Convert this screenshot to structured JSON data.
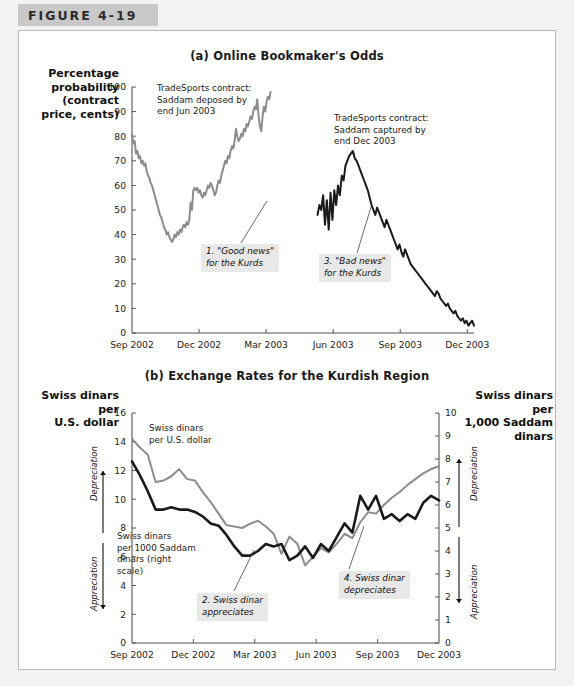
{
  "figure": {
    "tab_label": "FIGURE 4-19"
  },
  "panel_a": {
    "title": "(a) Online Bookmaker's Odds",
    "y_axis_title": "Percentage\nprobability\n(contract\nprice, cents)",
    "y_ticks": [
      0,
      10,
      20,
      30,
      40,
      50,
      60,
      70,
      80,
      90,
      100
    ],
    "x_ticks": [
      "Sep 2002",
      "Dec 2002",
      "Mar 2003",
      "Jun 2003",
      "Sep 2003",
      "Dec 2003"
    ],
    "note_deposed": "TradeSports contract:\nSaddam deposed by\nend Jun 2003",
    "note_captured": "TradeSports contract:\nSaddam captured by\nend Dec 2003",
    "callout_1": "1. \"Good news\"\nfor the Kurds",
    "callout_3": "3. \"Bad news\"\nfor the Kurds"
  },
  "panel_b": {
    "title": "(b) Exchange Rates for the Kurdish Region",
    "y_axis_title_left": "Swiss dinars per\nU.S. dollar",
    "y_axis_title_right": "Swiss dinars per\n1,000 Saddam\ndinars",
    "y_ticks_left": [
      0,
      2,
      4,
      6,
      8,
      10,
      12,
      14,
      16
    ],
    "y_ticks_right": [
      0,
      1,
      2,
      3,
      4,
      5,
      6,
      7,
      8,
      9,
      10
    ],
    "x_ticks": [
      "Sep 2002",
      "Dec 2002",
      "Mar 2003",
      "Jun 2003",
      "Sep 2003",
      "Dec 2003"
    ],
    "arrow_label_depreciation": "Depreciation",
    "arrow_label_appreciation": "Appreciation",
    "series_label_usd": "Swiss dinars\nper U.S. dollar",
    "series_label_saddam": "Swiss dinars\nper 1000 Saddam\ndinars (right\nscale)",
    "callout_2": "2. Swiss dinar\nappreciates",
    "callout_4": "4. Swiss dinar\ndepreciates"
  },
  "colors": {
    "gray_series": "#8c8c8c",
    "dark_series": "#1a1a1a",
    "axis": "#555555",
    "tab_band": "#c9c9c9",
    "page_bg": "#f2f2f2",
    "callout_bg": "#e8e8e8"
  },
  "chart_data": [
    {
      "type": "line",
      "title": "(a) Online Bookmaker's Odds",
      "xlabel": "",
      "ylabel": "Percentage probability (contract price, cents)",
      "ylim": [
        0,
        100
      ],
      "xlim": [
        "Sep 2002",
        "Dec 2003"
      ],
      "grid": false,
      "legend": "inline annotations",
      "x_tick_labels": [
        "Sep 2002",
        "Dec 2002",
        "Mar 2003",
        "Jun 2003",
        "Sep 2003",
        "Dec 2003"
      ],
      "y_tick_labels": [
        0,
        10,
        20,
        30,
        40,
        50,
        60,
        70,
        80,
        90,
        100
      ],
      "series": [
        {
          "name": "TradeSports contract: Saddam deposed by end Jun 2003",
          "color": "#8c8c8c",
          "x_start_month": 0.0,
          "x_end_month": 6.2,
          "values": [
            81,
            77,
            78,
            73,
            74,
            71,
            72,
            69,
            70,
            68,
            69,
            66,
            64,
            63,
            61,
            60,
            58,
            56,
            54,
            52,
            50,
            48,
            47,
            45,
            43,
            42,
            40,
            41,
            39,
            38,
            37,
            38,
            40,
            39,
            41,
            40,
            42,
            41,
            43,
            44,
            43,
            45,
            44,
            46,
            53,
            50,
            58,
            59,
            58,
            59,
            57,
            58,
            56,
            55,
            57,
            56,
            58,
            60,
            59,
            61,
            60,
            58,
            56,
            57,
            60,
            62,
            61,
            64,
            66,
            68,
            70,
            69,
            72,
            71,
            74,
            76,
            75,
            78,
            83,
            80,
            78,
            79,
            81,
            80,
            83,
            82,
            85,
            84,
            86,
            88,
            87,
            90,
            92,
            91,
            95,
            88,
            84,
            82,
            88,
            92,
            90,
            94,
            96,
            95,
            98
          ]
        },
        {
          "name": "TradeSports contract: Saddam captured by end Dec 2003",
          "color": "#1a1a1a",
          "x_start_month": 8.3,
          "x_end_month": 15.3,
          "values": [
            48,
            52,
            50,
            56,
            44,
            54,
            42,
            57,
            46,
            58,
            52,
            60,
            56,
            64,
            62,
            68,
            70,
            72,
            73,
            74,
            71,
            70,
            68,
            66,
            64,
            62,
            60,
            58,
            55,
            52,
            50,
            48,
            51,
            49,
            47,
            45,
            43,
            46,
            44,
            42,
            40,
            38,
            36,
            34,
            36,
            33,
            31,
            34,
            32,
            30,
            28,
            27,
            26,
            25,
            24,
            23,
            22,
            21,
            20,
            19,
            18,
            17,
            16,
            15,
            17,
            16,
            14,
            13,
            12,
            11,
            12,
            10,
            9,
            8,
            9,
            7,
            6,
            5,
            6,
            4,
            5,
            3,
            4,
            5,
            3
          ]
        }
      ]
    },
    {
      "type": "line",
      "title": "(b) Exchange Rates for the Kurdish Region",
      "xlabel": "",
      "ylabel_left": "Swiss dinars per U.S. dollar",
      "ylabel_right": "Swiss dinars per 1,000 Saddam dinars",
      "ylim_left": [
        0,
        16
      ],
      "ylim_right": [
        0,
        10
      ],
      "grid": false,
      "x_tick_labels": [
        "Sep 2002",
        "Dec 2002",
        "Mar 2003",
        "Jun 2003",
        "Sep 2003",
        "Dec 2003"
      ],
      "y_tick_labels_left": [
        0,
        2,
        4,
        6,
        8,
        10,
        12,
        14,
        16
      ],
      "y_tick_labels_right": [
        0,
        1,
        2,
        3,
        4,
        5,
        6,
        7,
        8,
        9,
        10
      ],
      "series": [
        {
          "name": "Swiss dinars per U.S. dollar",
          "color": "#8c8c8c",
          "axis": "left",
          "values": [
            14.2,
            13.6,
            13.1,
            11.2,
            11.3,
            11.6,
            12.1,
            11.4,
            11.3,
            10.5,
            9.8,
            9.0,
            8.2,
            8.1,
            8.0,
            8.3,
            8.5,
            8.1,
            7.6,
            6.2,
            7.4,
            6.9,
            5.4,
            6.0,
            6.6,
            6.3,
            6.9,
            7.6,
            7.3,
            8.4,
            9.1,
            9.0,
            9.6,
            10.1,
            10.5,
            11.0,
            11.4,
            11.8,
            12.1,
            12.3
          ]
        },
        {
          "name": "Swiss dinars per 1000 Saddam dinars (right scale)",
          "color": "#1a1a1a",
          "axis": "right",
          "values": [
            7.9,
            7.3,
            6.6,
            5.8,
            5.8,
            5.9,
            5.8,
            5.8,
            5.7,
            5.5,
            5.2,
            5.1,
            4.7,
            4.2,
            3.8,
            3.8,
            4.0,
            4.3,
            4.2,
            4.3,
            3.6,
            3.8,
            4.2,
            3.7,
            4.3,
            4.0,
            4.6,
            5.2,
            4.8,
            6.4,
            5.8,
            6.4,
            5.4,
            5.6,
            5.3,
            5.6,
            5.4,
            6.1,
            6.4,
            6.2
          ]
        }
      ]
    }
  ]
}
